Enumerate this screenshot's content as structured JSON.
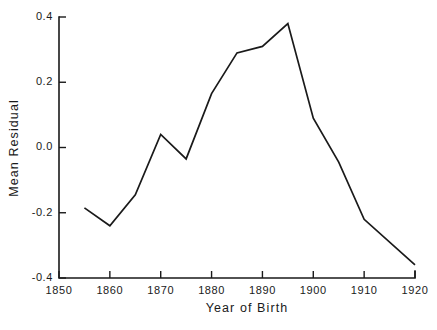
{
  "chart_data": {
    "type": "line",
    "title": "",
    "xlabel": "Year of Birth",
    "ylabel": "Mean Residual",
    "xlim": [
      1850,
      1920
    ],
    "ylim": [
      -0.4,
      0.4
    ],
    "grid": false,
    "legend": "none",
    "xticks": [
      1850,
      1860,
      1870,
      1880,
      1890,
      1900,
      1910,
      1920
    ],
    "xtick_labels": [
      "1850",
      "1860",
      "1870",
      "1880",
      "1890",
      "1900",
      "1910",
      "1920"
    ],
    "yticks": [
      -0.4,
      -0.2,
      0.0,
      0.2,
      0.4
    ],
    "ytick_labels": [
      "-0.4",
      "-0.2",
      "0.0",
      "0.2",
      "0.4"
    ],
    "x": [
      1855,
      1860,
      1865,
      1870,
      1875,
      1880,
      1885,
      1890,
      1895,
      1900,
      1905,
      1910,
      1920
    ],
    "values": [
      -0.185,
      -0.24,
      -0.145,
      0.04,
      -0.035,
      0.165,
      0.29,
      0.31,
      0.38,
      0.09,
      -0.045,
      -0.22,
      -0.36
    ],
    "series": [
      {
        "name": "Mean Residual",
        "color": "#1a1a1a",
        "values": [
          -0.185,
          -0.24,
          -0.145,
          0.04,
          -0.035,
          0.165,
          0.29,
          0.31,
          0.38,
          0.09,
          -0.045,
          -0.22,
          -0.36
        ]
      }
    ]
  }
}
